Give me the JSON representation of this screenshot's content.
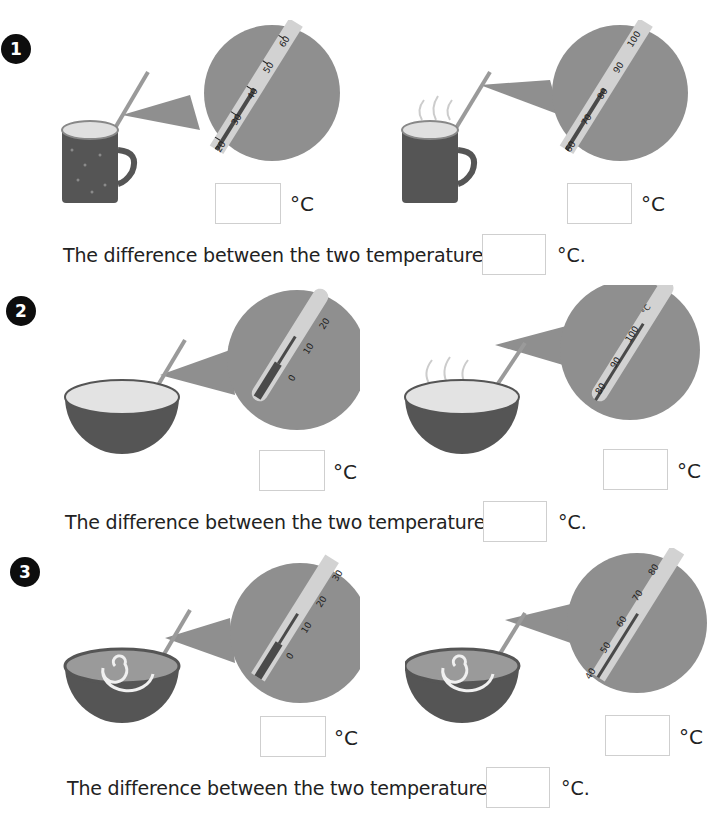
{
  "worksheet": {
    "colors": {
      "badge": "#0d0d0d",
      "bubble": "#8f8f8f",
      "thermo_strip": "#d2d2d2",
      "mercury": "#4a4a4a",
      "container": "#5a5a5a",
      "liquid_light": "#e3e3e3",
      "liquid_soup": "#9a9a9a",
      "box_border": "#cfcfcf"
    },
    "problems": [
      {
        "number": "1",
        "container": "mug",
        "left": {
          "steam": false,
          "scale_labels": [
            "20",
            "30",
            "40",
            "50",
            "60"
          ],
          "reading": 40,
          "unit": "°C",
          "answer": ""
        },
        "right": {
          "steam": true,
          "scale_labels": [
            "60",
            "70",
            "80",
            "90",
            "100"
          ],
          "reading": 80,
          "unit": "°C",
          "answer": ""
        },
        "difference_text": "The difference between the two temperatures is",
        "difference_unit": "°C.",
        "difference_answer": ""
      },
      {
        "number": "2",
        "container": "bowl",
        "left": {
          "steam": false,
          "scale_labels": [
            "0",
            "10",
            "20"
          ],
          "reading": 10,
          "unit": "°C",
          "answer": ""
        },
        "right": {
          "steam": true,
          "scale_labels": [
            "80",
            "90",
            "100",
            "°C"
          ],
          "reading": 100,
          "unit": "°C",
          "answer": ""
        },
        "difference_text": "The difference between the two temperatures is",
        "difference_unit": "°C.",
        "difference_answer": ""
      },
      {
        "number": "3",
        "container": "soup-bowl",
        "left": {
          "steam": false,
          "scale_labels": [
            "0",
            "10",
            "20",
            "30"
          ],
          "reading": 15,
          "unit": "°C",
          "answer": ""
        },
        "right": {
          "steam": false,
          "scale_labels": [
            "40",
            "50",
            "60",
            "70",
            "80"
          ],
          "reading": 65,
          "unit": "°C",
          "answer": ""
        },
        "difference_text": "The difference between the two temperatures is",
        "difference_unit": "°C.",
        "difference_answer": ""
      }
    ]
  }
}
